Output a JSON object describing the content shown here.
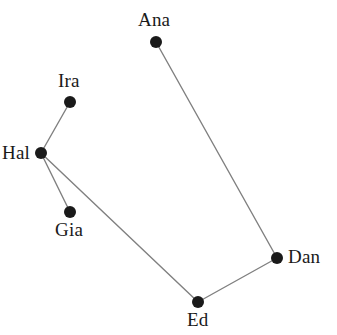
{
  "figure": {
    "type": "node-link-graph",
    "width": 337,
    "height": 335,
    "background_color": "#ffffff"
  },
  "style": {
    "node_color": "#1a1a1a",
    "node_radius": 6,
    "edge_color": "#808080",
    "edge_width": 1.4,
    "label_color": "#1a1a1a",
    "label_font_size": 19
  },
  "chart_data": {
    "type": "scatter",
    "title": "",
    "xlabel": "",
    "ylabel": "",
    "nodes": [
      {
        "id": "ana",
        "label": "Ana",
        "x": 156,
        "y": 42,
        "label_x": 138,
        "label_y": 10,
        "label_anchor": "above"
      },
      {
        "id": "ira",
        "label": "Ira",
        "x": 70,
        "y": 102,
        "label_x": 58,
        "label_y": 71,
        "label_anchor": "above"
      },
      {
        "id": "hal",
        "label": "Hal",
        "x": 41,
        "y": 153,
        "label_x": 2,
        "label_y": 143,
        "label_anchor": "left"
      },
      {
        "id": "gia",
        "label": "Gia",
        "x": 70,
        "y": 212,
        "label_x": 55,
        "label_y": 220,
        "label_anchor": "below"
      },
      {
        "id": "ed",
        "label": "Ed",
        "x": 198,
        "y": 302,
        "label_x": 187,
        "label_y": 310,
        "label_anchor": "below"
      },
      {
        "id": "dan",
        "label": "Dan",
        "x": 277,
        "y": 258,
        "label_x": 288,
        "label_y": 247,
        "label_anchor": "right"
      }
    ],
    "edges": [
      {
        "from": "ana",
        "to": "dan"
      },
      {
        "from": "ira",
        "to": "hal"
      },
      {
        "from": "hal",
        "to": "gia"
      },
      {
        "from": "hal",
        "to": "ed"
      },
      {
        "from": "ed",
        "to": "dan"
      }
    ],
    "legend": [],
    "grid": false,
    "axes_visible": false
  }
}
